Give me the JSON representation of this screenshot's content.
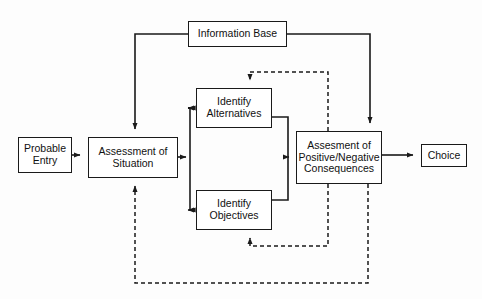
{
  "diagram": {
    "background_color": "#fdfdfd",
    "line_color": "#1a1a1a",
    "text_color": "#111111",
    "nodes": [
      {
        "id": "probable-entry",
        "label": "Probable\nEntry"
      },
      {
        "id": "assessment-situation",
        "label": "Assessment of\nSituation"
      },
      {
        "id": "identify-alternatives",
        "label": "Identify\nAlternatives"
      },
      {
        "id": "identify-objectives",
        "label": "Identify\nObjectives"
      },
      {
        "id": "assessment-consequences",
        "label": "Assesment of\nPositive/Negative\nConsequences"
      },
      {
        "id": "choice",
        "label": "Choice"
      },
      {
        "id": "information-base",
        "label": "Information Base"
      }
    ],
    "edges": [
      {
        "id": "edge-entry-to-assessment",
        "from": "probable-entry",
        "to": "assessment-situation",
        "style": "solid",
        "arrow": true
      },
      {
        "id": "edge-assessment-to-alternatives",
        "from": "assessment-situation",
        "to": "identify-alternatives",
        "style": "solid",
        "arrow": true
      },
      {
        "id": "edge-assessment-to-objectives",
        "from": "assessment-situation",
        "to": "identify-objectives",
        "style": "solid",
        "arrow": true
      },
      {
        "id": "edge-alternatives-to-consequences",
        "from": "identify-alternatives",
        "to": "assessment-consequences",
        "style": "solid",
        "arrow": true
      },
      {
        "id": "edge-objectives-to-consequences",
        "from": "identify-objectives",
        "to": "assessment-consequences",
        "style": "solid",
        "arrow": true
      },
      {
        "id": "edge-consequences-to-choice",
        "from": "assessment-consequences",
        "to": "choice",
        "style": "solid",
        "arrow": true
      },
      {
        "id": "edge-infobase-to-assessment",
        "from": "information-base",
        "to": "assessment-situation",
        "style": "solid",
        "arrow": true
      },
      {
        "id": "edge-infobase-to-consequences",
        "from": "information-base",
        "to": "assessment-consequences",
        "style": "solid",
        "arrow": true
      },
      {
        "id": "edge-consequences-to-alternatives-feedback",
        "from": "assessment-consequences",
        "to": "identify-alternatives",
        "style": "dashed",
        "arrow": true
      },
      {
        "id": "edge-consequences-to-objectives-feedback",
        "from": "assessment-consequences",
        "to": "identify-objectives",
        "style": "dashed",
        "arrow": true
      },
      {
        "id": "edge-consequences-to-assessment-feedback",
        "from": "assessment-consequences",
        "to": "assessment-situation",
        "style": "dashed",
        "arrow": true
      }
    ]
  }
}
